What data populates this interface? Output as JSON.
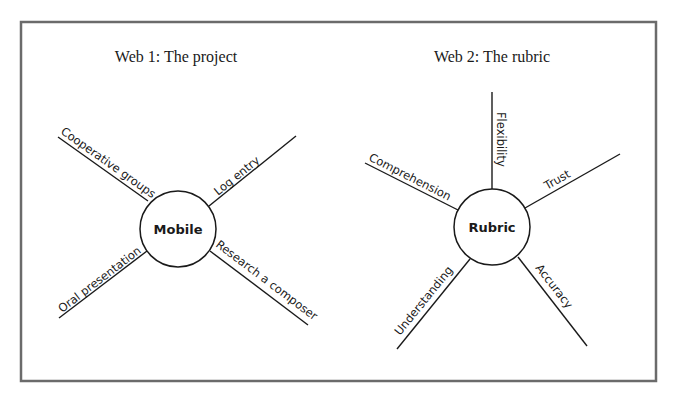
{
  "frame": {
    "x": 21,
    "y": 22,
    "width": 635,
    "height": 359,
    "border_color": "#6b6b6b"
  },
  "webs": [
    {
      "title": "Web 1: The project",
      "title_pos": {
        "x": 176,
        "y": 62
      },
      "hub": {
        "label": "Mobile",
        "cx": 178,
        "cy": 229,
        "r": 38
      },
      "spokes": [
        {
          "label": "Cooperative groups",
          "x1": 148,
          "y1": 201,
          "x2": 58,
          "y2": 137,
          "text_x": 60,
          "text_y": 133,
          "angle": 35.4
        },
        {
          "label": "Log entry",
          "x1": 209,
          "y1": 206,
          "x2": 296,
          "y2": 136,
          "text_x": 218,
          "text_y": 196,
          "angle": -38.8
        },
        {
          "label": "Oral presentation",
          "x1": 147,
          "y1": 251,
          "x2": 59,
          "y2": 318,
          "text_x": 62,
          "text_y": 313,
          "angle": -37.3
        },
        {
          "label": "Research a composer",
          "x1": 210,
          "y1": 251,
          "x2": 308,
          "y2": 325,
          "text_x": 215,
          "text_y": 246,
          "angle": 37.1
        }
      ]
    },
    {
      "title": "Web 2: The rubric",
      "title_pos": {
        "x": 492,
        "y": 62
      },
      "hub": {
        "label": "Rubric",
        "cx": 492,
        "cy": 227,
        "r": 38
      },
      "spokes": [
        {
          "label": "Flexibility",
          "x1": 492,
          "y1": 189,
          "x2": 492,
          "y2": 92,
          "text_x": 497,
          "text_y": 112,
          "angle": 90
        },
        {
          "label": "Comprehension",
          "x1": 458,
          "y1": 210,
          "x2": 365,
          "y2": 163,
          "text_x": 368,
          "text_y": 160,
          "angle": 26.8
        },
        {
          "label": "Trust",
          "x1": 525,
          "y1": 208,
          "x2": 620,
          "y2": 154,
          "text_x": 547,
          "text_y": 190,
          "angle": -29.6
        },
        {
          "label": "Understanding",
          "x1": 470,
          "y1": 259,
          "x2": 397,
          "y2": 349,
          "text_x": 400,
          "text_y": 336,
          "angle": -51
        },
        {
          "label": "Accuracy",
          "x1": 518,
          "y1": 257,
          "x2": 587,
          "y2": 346,
          "text_x": 535,
          "text_y": 268,
          "angle": 52.2
        }
      ]
    }
  ]
}
